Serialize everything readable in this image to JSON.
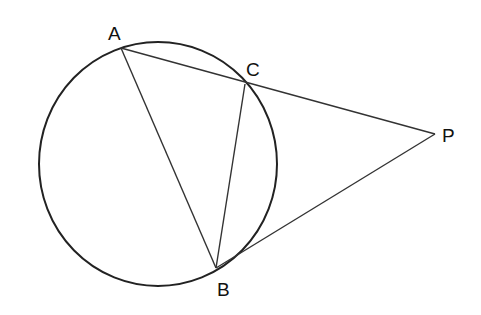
{
  "diagram": {
    "type": "geometry",
    "stroke_color": "#222222",
    "circle": {
      "cx": 158,
      "cy": 164,
      "rx": 119,
      "ry": 122
    },
    "points": {
      "A": {
        "label": "A",
        "x": 121,
        "y": 48
      },
      "B": {
        "label": "B",
        "x": 216,
        "y": 268
      },
      "C": {
        "label": "C",
        "x": 245,
        "y": 84
      },
      "P": {
        "label": "P",
        "x": 435,
        "y": 134
      }
    },
    "segments": [
      [
        "A",
        "C"
      ],
      [
        "C",
        "P"
      ],
      [
        "A",
        "B"
      ],
      [
        "C",
        "B"
      ],
      [
        "B",
        "P"
      ]
    ]
  }
}
